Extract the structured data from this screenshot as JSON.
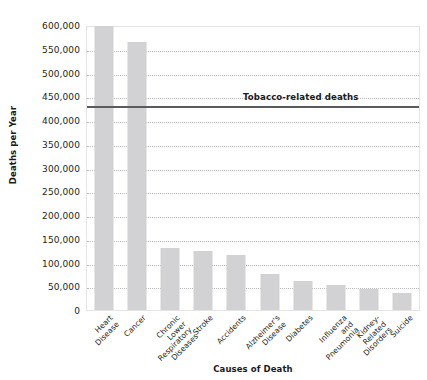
{
  "chart_data": {
    "type": "bar",
    "title": "",
    "xlabel": "Causes of Death",
    "ylabel": "Deaths per Year",
    "ylim": [
      0,
      600000
    ],
    "grid": true,
    "legend": false,
    "categories": [
      "Heart Disease",
      "Cancer",
      "Chronic Lower\nRespiratory\nDiseases",
      "Stroke",
      "Accidents",
      "Alzheimer's\nDisease",
      "Diabetes",
      "Influenza and\nPneumonia",
      "Kidney-Related\nDisorders",
      "Suicide"
    ],
    "values": [
      597000,
      565000,
      130000,
      125000,
      115000,
      75000,
      62000,
      52000,
      45000,
      35000
    ],
    "ytick_labels": [
      "600,000",
      "550,000",
      "500,000",
      "450,000",
      "400,000",
      "350,000",
      "300,000",
      "250,000",
      "200,000",
      "150,000",
      "100,000",
      "50,000",
      "0"
    ],
    "ytick_values": [
      600000,
      550000,
      500000,
      450000,
      400000,
      350000,
      300000,
      250000,
      200000,
      150000,
      100000,
      50000,
      0
    ],
    "annotations": [
      {
        "label": "Tobacco-related deaths",
        "value": 433000,
        "type": "horizontal-line"
      }
    ],
    "colors": {
      "bar": "#d2d2d4",
      "threshold_line": "#5a5a5f",
      "gridline": "#bcbcbe",
      "plot_border": "#e4e4e6",
      "text": "#231f20",
      "background": "#ffffff"
    }
  }
}
